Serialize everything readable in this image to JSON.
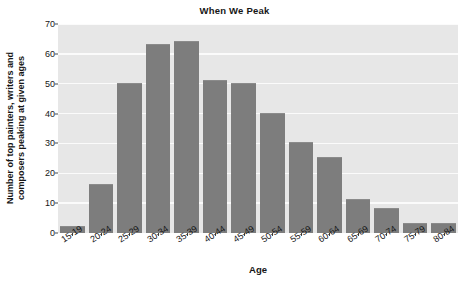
{
  "chart_data": {
    "type": "bar",
    "title": "When We Peak",
    "xlabel": "Age",
    "ylabel": "Number of top painters, writers and composers peaking at given ages",
    "ylabel_line1": "Number of top painters, writers and",
    "ylabel_line2": "composers peaking at given ages",
    "categories": [
      "15-19",
      "20-24",
      "25-29",
      "30-34",
      "35-39",
      "40-44",
      "45-49",
      "50-54",
      "55-59",
      "60-64",
      "65-69",
      "70-74",
      "75-79",
      "80-84"
    ],
    "values": [
      2,
      16,
      50,
      63,
      64,
      51,
      50,
      40,
      30,
      25,
      11,
      8,
      3,
      3
    ],
    "ylim": [
      0,
      70
    ],
    "yticks": [
      0,
      10,
      20,
      30,
      40,
      50,
      60,
      70
    ],
    "ytick_labels": [
      "0",
      "10",
      "20",
      "30",
      "40",
      "50",
      "60",
      "70"
    ],
    "grid": true,
    "legend": "none",
    "bar_color": "#7d7d7d",
    "plot_background": "#e7e7e7",
    "gridline_color": "#fbfbfb",
    "figure_background": "#ffffff"
  }
}
